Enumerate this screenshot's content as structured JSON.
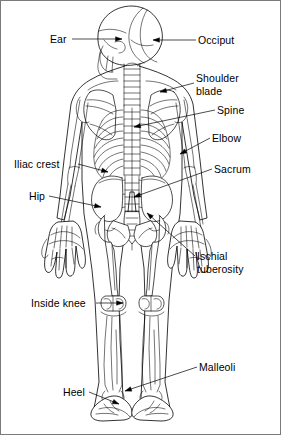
{
  "figure": {
    "view": "posterior",
    "line_color": "#000000",
    "background_color": "#ffffff",
    "border_color": "#7a7a7a"
  },
  "labels": [
    {
      "id": "ear",
      "text": "Ear",
      "side": "left",
      "x": 50,
      "y": 33,
      "lines": [
        "Ear"
      ]
    },
    {
      "id": "occiput",
      "text": "Occiput",
      "side": "right",
      "x": 198,
      "y": 34,
      "lines": [
        "Occiput"
      ]
    },
    {
      "id": "shoulder-blade",
      "text": "Shoulder blade",
      "side": "right",
      "x": 196,
      "y": 72,
      "lines": [
        "Shoulder",
        "blade"
      ]
    },
    {
      "id": "spine",
      "text": "Spine",
      "side": "right",
      "x": 217,
      "y": 104,
      "lines": [
        "Spine"
      ]
    },
    {
      "id": "elbow",
      "text": "Elbow",
      "side": "right",
      "x": 212,
      "y": 132,
      "lines": [
        "Elbow"
      ]
    },
    {
      "id": "sacrum",
      "text": "Sacrum",
      "side": "right",
      "x": 214,
      "y": 163,
      "lines": [
        "Sacrum"
      ]
    },
    {
      "id": "iliac-crest",
      "text": "Iliac crest",
      "side": "left",
      "x": 14,
      "y": 158,
      "lines": [
        "Iliac crest"
      ]
    },
    {
      "id": "hip",
      "text": "Hip",
      "side": "left",
      "x": 29,
      "y": 190,
      "lines": [
        "Hip"
      ]
    },
    {
      "id": "ischial-tuberosity",
      "text": "Ischial tuberosity",
      "side": "right",
      "x": 197,
      "y": 250,
      "lines": [
        "Ischial",
        "tuberosity"
      ]
    },
    {
      "id": "inside-knee",
      "text": "Inside knee",
      "side": "left",
      "x": 31,
      "y": 297,
      "lines": [
        "Inside knee"
      ]
    },
    {
      "id": "malleoli",
      "text": "Malleoli",
      "side": "right",
      "x": 199,
      "y": 361,
      "lines": [
        "Malleoli"
      ]
    },
    {
      "id": "heel",
      "text": "Heel",
      "side": "left",
      "x": 63,
      "y": 386,
      "lines": [
        "Heel"
      ]
    }
  ],
  "leaders": [
    {
      "id": "ear",
      "path": "M 72 39 L 122 39",
      "arrow": [
        122,
        39,
        1,
        0
      ]
    },
    {
      "id": "occiput",
      "path": "M 196 40 L 153 40",
      "arrow": [
        153,
        40,
        -1,
        0
      ]
    },
    {
      "id": "shoulder-blade",
      "path": "M 194 83 L 160 92",
      "arrow": [
        160,
        92,
        -1,
        0.26
      ]
    },
    {
      "id": "spine",
      "path": "M 215 110 L 134 127",
      "arrow": [
        134,
        127,
        -1,
        0.21
      ]
    },
    {
      "id": "elbow",
      "path": "M 210 138 L 180 154",
      "arrow": [
        180,
        154,
        -1,
        0.53
      ]
    },
    {
      "id": "sacrum",
      "path": "M 212 169 L 134 197",
      "arrow": [
        134,
        197,
        -1,
        0.36
      ]
    },
    {
      "id": "iliac-crest",
      "path": "M 78 164 L 108 172",
      "arrow": [
        108,
        172,
        1,
        0.27
      ]
    },
    {
      "id": "hip",
      "path": "M 49 196 L 101 207",
      "arrow": [
        101,
        207,
        1,
        0.21
      ]
    },
    {
      "id": "ischial-tuberosity",
      "path": "M 195 256 L 147 213",
      "arrow": [
        147,
        213,
        -1,
        -0.9
      ]
    },
    {
      "id": "inside-knee",
      "path": "M 96 303 L 123 303",
      "arrow": [
        123,
        303,
        1,
        0
      ]
    },
    {
      "id": "malleoli",
      "path": "M 197 367 L 125 391",
      "arrow": [
        125,
        391,
        -1,
        0.33
      ]
    },
    {
      "id": "heel",
      "path": "M 89 392 L 119 404",
      "arrow": [
        119,
        404,
        1,
        0.4
      ]
    }
  ]
}
